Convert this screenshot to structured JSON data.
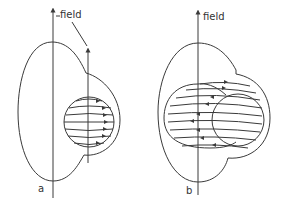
{
  "figure": {
    "panels": [
      {
        "id": "a",
        "label": "a",
        "field_label": "field",
        "description": "Single field axis with spherical region showing circulating flow lines (arrows pointing right) offset from main axis"
      },
      {
        "id": "b",
        "label": "b",
        "field_label": "field",
        "description": "Field axis through an elongated ellipsoidal region with curved flow lines (arrows pointing left/right) overlapping a smaller sphere"
      }
    ],
    "colors": {
      "line": "#3a3a3a",
      "background": "#ffffff"
    }
  }
}
